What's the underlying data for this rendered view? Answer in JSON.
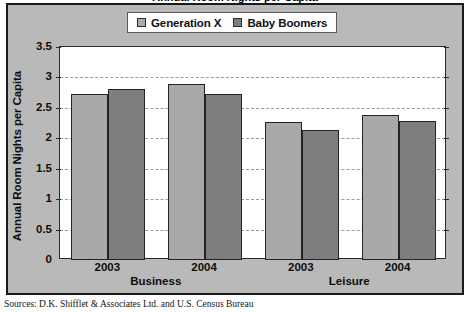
{
  "figure": {
    "clipped_title": "Annual Room Nights per Capita",
    "source_note": "Sources: D.K. Shifflet & Associates Ltd. and U.S. Census Bureau",
    "frame_background": "#b9b9b9",
    "plot_background": "#ffffff"
  },
  "legend": {
    "position": "top-center",
    "entries": [
      {
        "label": "Generation X",
        "color": "#a9a9a9",
        "swatch_name": "legend-swatch-generation-x"
      },
      {
        "label": "Baby Boomers",
        "color": "#7e7e7e",
        "swatch_name": "legend-swatch-baby-boomers"
      }
    ]
  },
  "chart_data": {
    "type": "bar",
    "title": "Annual Room Nights per Capita",
    "xlabel": "",
    "ylabel": "Annual Room Nights per Capita",
    "ylim": [
      0,
      3.5
    ],
    "yticks": [
      0,
      0.5,
      1,
      1.5,
      2,
      2.5,
      3,
      3.5
    ],
    "ytick_labels": [
      "0",
      "0.5",
      "1",
      "1.5",
      "2",
      "2.5",
      "3",
      "3.5"
    ],
    "grid": true,
    "grid_axis": "y",
    "grid_style": "dashed",
    "legend_position": "top-center",
    "categories": [
      "2003",
      "2004",
      "2003",
      "2004"
    ],
    "category_groups": [
      {
        "label": "Business",
        "years": [
          "2003",
          "2004"
        ]
      },
      {
        "label": "Leisure",
        "years": [
          "2003",
          "2004"
        ]
      }
    ],
    "series": [
      {
        "name": "Generation X",
        "color": "#a9a9a9",
        "values": [
          2.72,
          2.89,
          2.26,
          2.39
        ]
      },
      {
        "name": "Baby Boomers",
        "color": "#7e7e7e",
        "values": [
          2.81,
          2.72,
          2.13,
          2.29
        ]
      }
    ],
    "annotations": [],
    "source": "Sources: D.K. Shifflet & Associates Ltd. and U.S. Census Bureau"
  }
}
